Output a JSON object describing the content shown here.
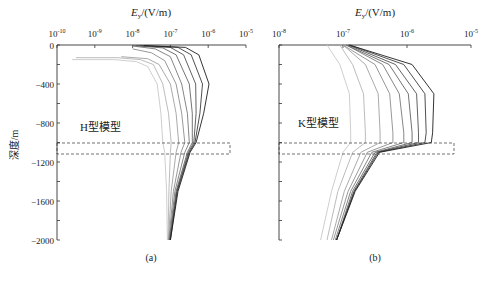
{
  "figure": {
    "y_label": "深度/m",
    "x_label_prefix": "E",
    "x_label_sub": "y",
    "x_label_unit": "/(V/m)"
  },
  "chart_data": [
    {
      "type": "line",
      "panel_label": "(a)",
      "annotation": "H型模型",
      "xlabel": "Ey/(V/m)",
      "ylabel": "深度/m",
      "xscale": "log",
      "xlim": [
        1e-10,
        1e-05
      ],
      "x_ticks": [
        "10^-10",
        "10^-9",
        "10^-8",
        "10^-7",
        "10^-6",
        "10^-5"
      ],
      "x_tick_exp": [
        -10,
        -9,
        -8,
        -7,
        -6,
        -5
      ],
      "ylim": [
        -2000,
        0
      ],
      "y_ticks": [
        0,
        -400,
        -800,
        -1200,
        -1600,
        -2000
      ],
      "target_layer_depth": [
        -1000,
        -1100
      ],
      "series": [
        {
          "name": "curve-1",
          "shade": "#c8c8c8",
          "points": [
            [
              -150,
              -9.6
            ],
            [
              -150,
              -8.5
            ],
            [
              -170,
              -7.9
            ],
            [
              -220,
              -7.6
            ],
            [
              -400,
              -7.35
            ],
            [
              -700,
              -7.25
            ],
            [
              -1000,
              -7.2
            ],
            [
              -1100,
              -7.15
            ],
            [
              -1500,
              -7.1
            ],
            [
              -2000,
              -7.08
            ]
          ]
        },
        {
          "name": "curve-2",
          "shade": "#b4b4b4",
          "points": [
            [
              -130,
              -9.5
            ],
            [
              -130,
              -8.4
            ],
            [
              -150,
              -7.8
            ],
            [
              -200,
              -7.45
            ],
            [
              -400,
              -7.2
            ],
            [
              -700,
              -7.05
            ],
            [
              -1000,
              -6.98
            ],
            [
              -1100,
              -7.0
            ],
            [
              -1500,
              -7.04
            ],
            [
              -2000,
              -7.06
            ]
          ]
        },
        {
          "name": "curve-3",
          "shade": "#a0a0a0",
          "points": [
            [
              -120,
              -8.3
            ],
            [
              -140,
              -7.6
            ],
            [
              -200,
              -7.3
            ],
            [
              -400,
              -7.0
            ],
            [
              -700,
              -6.85
            ],
            [
              -1000,
              -6.78
            ],
            [
              -1100,
              -6.85
            ],
            [
              -1500,
              -6.98
            ],
            [
              -2000,
              -7.05
            ]
          ]
        },
        {
          "name": "curve-4",
          "shade": "#8c8c8c",
          "points": [
            [
              -40,
              -8.0
            ],
            [
              -80,
              -7.5
            ],
            [
              -160,
              -7.15
            ],
            [
              -400,
              -6.85
            ],
            [
              -700,
              -6.7
            ],
            [
              -1000,
              -6.62
            ],
            [
              -1100,
              -6.72
            ],
            [
              -1500,
              -6.92
            ],
            [
              -2000,
              -7.04
            ]
          ]
        },
        {
          "name": "curve-5",
          "shade": "#787878",
          "points": [
            [
              -10,
              -8.0
            ],
            [
              -40,
              -7.4
            ],
            [
              -120,
              -7.0
            ],
            [
              -400,
              -6.7
            ],
            [
              -700,
              -6.55
            ],
            [
              -1000,
              -6.5
            ],
            [
              -1100,
              -6.62
            ],
            [
              -1500,
              -6.88
            ],
            [
              -2000,
              -7.03
            ]
          ]
        },
        {
          "name": "curve-6",
          "shade": "#646464",
          "points": [
            [
              -5,
              -8.0
            ],
            [
              -30,
              -7.2
            ],
            [
              -100,
              -6.85
            ],
            [
              -400,
              -6.5
            ],
            [
              -700,
              -6.42
            ],
            [
              -1000,
              -6.42
            ],
            [
              -1100,
              -6.55
            ],
            [
              -1500,
              -6.85
            ],
            [
              -2000,
              -7.02
            ]
          ]
        },
        {
          "name": "curve-7",
          "shade": "#505050",
          "points": [
            [
              -5,
              -7.9
            ],
            [
              -25,
              -7.0
            ],
            [
              -100,
              -6.65
            ],
            [
              -400,
              -6.33
            ],
            [
              -700,
              -6.32
            ],
            [
              -1000,
              -6.38
            ],
            [
              -1100,
              -6.52
            ],
            [
              -1500,
              -6.83
            ],
            [
              -2000,
              -7.01
            ]
          ]
        },
        {
          "name": "curve-8",
          "shade": "#3c3c3c",
          "points": [
            [
              -5,
              -7.8
            ],
            [
              -25,
              -6.8
            ],
            [
              -100,
              -6.45
            ],
            [
              -400,
              -6.15
            ],
            [
              -700,
              -6.22
            ],
            [
              -1000,
              -6.35
            ],
            [
              -1100,
              -6.5
            ],
            [
              -1500,
              -6.82
            ],
            [
              -2000,
              -7.0
            ]
          ]
        },
        {
          "name": "curve-9",
          "shade": "#1e1e1e",
          "points": [
            [
              -5,
              -7.7
            ],
            [
              -25,
              -6.6
            ],
            [
              -100,
              -6.25
            ],
            [
              -400,
              -5.98
            ],
            [
              -700,
              -6.12
            ],
            [
              -1000,
              -6.32
            ],
            [
              -1100,
              -6.48
            ],
            [
              -1500,
              -6.8
            ],
            [
              -2000,
              -7.0
            ]
          ]
        }
      ]
    },
    {
      "type": "line",
      "panel_label": "(b)",
      "annotation": "K型模型",
      "xlabel": "Ey/(V/m)",
      "ylabel": "深度/m",
      "xscale": "log",
      "xlim": [
        1e-08,
        1e-05
      ],
      "x_ticks": [
        "10^-8",
        "10^-7",
        "10^-6",
        "10^-5"
      ],
      "x_tick_exp": [
        -8,
        -7,
        -6,
        -5
      ],
      "ylim": [
        -2000,
        0
      ],
      "y_ticks": [
        0,
        -200,
        -400,
        -600,
        -800,
        -1000,
        -1200,
        -1400,
        -1600,
        -1800,
        -2000
      ],
      "target_layer_depth": [
        -1000,
        -1100
      ],
      "series": [
        {
          "name": "curve-1",
          "shade": "#c8c8c8",
          "points": [
            [
              0,
              -7.25
            ],
            [
              -200,
              -7.05
            ],
            [
              -500,
              -6.9
            ],
            [
              -900,
              -6.88
            ],
            [
              -1000,
              -6.88
            ],
            [
              -1100,
              -7.0
            ],
            [
              -1500,
              -7.18
            ],
            [
              -2000,
              -7.35
            ]
          ]
        },
        {
          "name": "curve-2",
          "shade": "#b4b4b4",
          "points": [
            [
              0,
              -7.05
            ],
            [
              -200,
              -6.85
            ],
            [
              -500,
              -6.68
            ],
            [
              -900,
              -6.65
            ],
            [
              -1000,
              -6.65
            ],
            [
              -1100,
              -6.85
            ],
            [
              -1500,
              -7.08
            ],
            [
              -2000,
              -7.25
            ]
          ]
        },
        {
          "name": "curve-3",
          "shade": "#a0a0a0",
          "points": [
            [
              0,
              -7.0
            ],
            [
              -200,
              -6.65
            ],
            [
              -500,
              -6.45
            ],
            [
              -900,
              -6.42
            ],
            [
              -1000,
              -6.42
            ],
            [
              -1100,
              -6.72
            ],
            [
              -1500,
              -6.98
            ],
            [
              -2000,
              -7.18
            ]
          ]
        },
        {
          "name": "curve-4",
          "shade": "#8c8c8c",
          "points": [
            [
              0,
              -7.0
            ],
            [
              -200,
              -6.5
            ],
            [
              -500,
              -6.27
            ],
            [
              -900,
              -6.22
            ],
            [
              -1000,
              -6.22
            ],
            [
              -1100,
              -6.62
            ],
            [
              -1500,
              -6.92
            ],
            [
              -2000,
              -7.15
            ]
          ]
        },
        {
          "name": "curve-5",
          "shade": "#787878",
          "points": [
            [
              0,
              -6.95
            ],
            [
              -200,
              -6.38
            ],
            [
              -500,
              -6.12
            ],
            [
              -900,
              -6.05
            ],
            [
              -1000,
              -6.05
            ],
            [
              -1100,
              -6.55
            ],
            [
              -1500,
              -6.88
            ],
            [
              -2000,
              -7.12
            ]
          ]
        },
        {
          "name": "curve-6",
          "shade": "#646464",
          "points": [
            [
              0,
              -6.95
            ],
            [
              -200,
              -6.28
            ],
            [
              -500,
              -5.98
            ],
            [
              -900,
              -5.92
            ],
            [
              -1000,
              -5.92
            ],
            [
              -1100,
              -6.5
            ],
            [
              -1500,
              -6.85
            ],
            [
              -2000,
              -7.1
            ]
          ]
        },
        {
          "name": "curve-7",
          "shade": "#505050",
          "points": [
            [
              0,
              -6.92
            ],
            [
              -200,
              -6.18
            ],
            [
              -500,
              -5.85
            ],
            [
              -900,
              -5.82
            ],
            [
              -1000,
              -5.82
            ],
            [
              -1100,
              -6.47
            ],
            [
              -1500,
              -6.83
            ],
            [
              -2000,
              -7.1
            ]
          ]
        },
        {
          "name": "curve-8",
          "shade": "#3c3c3c",
          "points": [
            [
              0,
              -6.9
            ],
            [
              -200,
              -6.05
            ],
            [
              -500,
              -5.72
            ],
            [
              -900,
              -5.7
            ],
            [
              -1000,
              -5.72
            ],
            [
              -1100,
              -6.45
            ],
            [
              -1500,
              -6.82
            ],
            [
              -2000,
              -7.1
            ]
          ]
        },
        {
          "name": "curve-9",
          "shade": "#1e1e1e",
          "points": [
            [
              0,
              -6.9
            ],
            [
              -200,
              -5.92
            ],
            [
              -500,
              -5.58
            ],
            [
              -900,
              -5.6
            ],
            [
              -1000,
              -5.62
            ],
            [
              -1100,
              -6.43
            ],
            [
              -1500,
              -6.81
            ],
            [
              -2000,
              -7.1
            ]
          ]
        }
      ]
    }
  ],
  "panels": [
    {
      "label": "(a)",
      "annotation": "H型模型"
    },
    {
      "label": "(b)",
      "annotation": "K型模型"
    }
  ]
}
